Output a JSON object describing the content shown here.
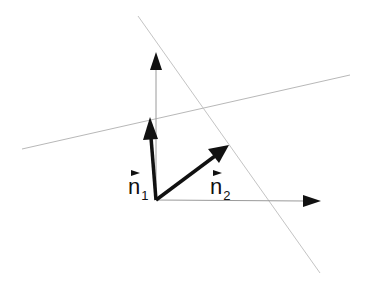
{
  "diagram": {
    "title": "",
    "colors": {
      "vector": "#111111",
      "axis": "#9a9a9a",
      "line": "#b8b8b8"
    },
    "labels": {
      "n1": {
        "base": "n",
        "sub": "1"
      },
      "n2": {
        "base": "n",
        "sub": "2"
      }
    },
    "origin": [
      156,
      200
    ],
    "axes": [
      {
        "name": "vertical-axis",
        "from": [
          156,
          200
        ],
        "to": [
          156,
          53
        ]
      },
      {
        "name": "horizontal-axis",
        "from": [
          156,
          200
        ],
        "to": [
          320,
          201
        ]
      }
    ],
    "lines": [
      {
        "name": "line-1",
        "from": [
          22,
          149
        ],
        "to": [
          350,
          75
        ]
      },
      {
        "name": "line-2",
        "from": [
          138,
          16
        ],
        "to": [
          320,
          273
        ]
      }
    ],
    "vectors": [
      {
        "name": "n1",
        "from": [
          156,
          200
        ],
        "to": [
          150,
          118
        ]
      },
      {
        "name": "n2",
        "from": [
          156,
          200
        ],
        "to": [
          228,
          146
        ]
      }
    ]
  }
}
